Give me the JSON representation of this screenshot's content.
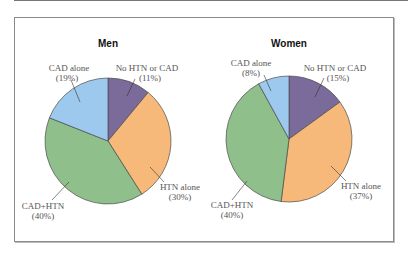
{
  "chart_data": [
    {
      "type": "pie",
      "title": "Men",
      "categories": [
        "No HTN or CAD",
        "HTN alone",
        "CAD+HTN",
        "CAD alone"
      ],
      "values": [
        11,
        30,
        40,
        19
      ],
      "labels": [
        "(11%)",
        "(30%)",
        "(40%)",
        "(19%)"
      ],
      "colors": [
        "#7b6b9b",
        "#f7b979",
        "#8fbf8b",
        "#9dc9ee"
      ],
      "start_angle": "12 o'clock, clockwise"
    },
    {
      "type": "pie",
      "title": "Women",
      "categories": [
        "No HTN or CAD",
        "HTN alone",
        "CAD+HTN",
        "CAD alone"
      ],
      "values": [
        15,
        37,
        40,
        8
      ],
      "labels": [
        "(15%)",
        "(37%)",
        "(40%)",
        "(8%)"
      ],
      "colors": [
        "#7b6b9b",
        "#f7b979",
        "#8fbf8b",
        "#9dc9ee"
      ],
      "start_angle": "12 o'clock, clockwise"
    }
  ],
  "men": {
    "title": "Men",
    "no_htn_cad": {
      "name": "No HTN or CAD",
      "pct": "(11%)"
    },
    "htn_alone": {
      "name": "HTN alone",
      "pct": "(30%)"
    },
    "cad_htn": {
      "name": "CAD+HTN",
      "pct": "(40%)"
    },
    "cad_alone": {
      "name": "CAD alone",
      "pct": "(19%)"
    }
  },
  "women": {
    "title": "Women",
    "no_htn_cad": {
      "name": "No HTN or CAD",
      "pct": "(15%)"
    },
    "htn_alone": {
      "name": "HTN alone",
      "pct": "(37%)"
    },
    "cad_htn": {
      "name": "CAD+HTN",
      "pct": "(40%)"
    },
    "cad_alone": {
      "name": "CAD alone",
      "pct": "(8%)"
    }
  }
}
